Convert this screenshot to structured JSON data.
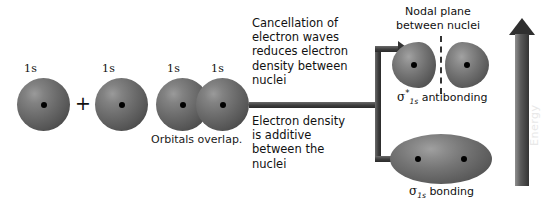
{
  "diagram": {
    "atomic_orbitals": {
      "labels": [
        "1s",
        "1s",
        "1s",
        "1s"
      ],
      "plus_sign": "+",
      "overlap_caption": "Orbitals overlap."
    },
    "annotations": {
      "antibonding_text": "Cancellation of\nelectron waves\nreduces electron\ndensity between\nnuclei",
      "bonding_text": "Electron density\nis additive\nbetween the\nnuclei",
      "nodal_plane_caption": "Nodal plane\nbetween nuclei"
    },
    "molecular_orbitals": [
      {
        "name": "antibonding",
        "symbol": "σ",
        "superscript": "*",
        "subscript": "1s",
        "label_text": "antibonding",
        "has_nodal_plane": true
      },
      {
        "name": "bonding",
        "symbol": "σ",
        "superscript": "",
        "subscript": "1s",
        "label_text": "bonding",
        "has_nodal_plane": false
      }
    ],
    "energy_axis": {
      "label": "Energy",
      "direction": "up"
    },
    "colors": {
      "orbital_dark": "#434343",
      "orbital_light": "#a2a2a2",
      "arrow": "#333333",
      "text": "#111111",
      "background": "#ffffff"
    }
  }
}
